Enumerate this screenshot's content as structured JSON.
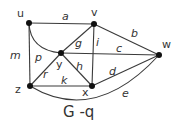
{
  "caption": "G -q",
  "vertices": {
    "u": {
      "label": "u",
      "x": 29,
      "y": 23
    },
    "v": {
      "label": "v",
      "x": 94,
      "y": 24
    },
    "w": {
      "label": "w",
      "x": 159,
      "y": 55
    },
    "y": {
      "label": "y",
      "x": 61,
      "y": 53
    },
    "z": {
      "label": "z",
      "x": 30,
      "y": 86
    },
    "x": {
      "label": "x",
      "x": 92,
      "y": 86
    }
  },
  "edges": {
    "a": {
      "label": "a",
      "from": "u",
      "to": "v"
    },
    "b": {
      "label": "b",
      "from": "v",
      "to": "w"
    },
    "c": {
      "label": "c",
      "from": "y",
      "to": "w"
    },
    "d": {
      "label": "d",
      "from": "x",
      "to": "w"
    },
    "e": {
      "label": "e",
      "from": "z",
      "to": "w",
      "curved": true
    },
    "g": {
      "label": "g",
      "from": "y",
      "to": "v"
    },
    "i": {
      "label": "i",
      "from": "v",
      "to": "x"
    },
    "h": {
      "label": "h",
      "from": "y",
      "to": "x"
    },
    "k": {
      "label": "k",
      "from": "z",
      "to": "x"
    },
    "r": {
      "label": "r",
      "from": "z",
      "to": "y"
    },
    "m": {
      "label": "m",
      "from": "u",
      "to": "z"
    },
    "p": {
      "label": "p",
      "from": "u",
      "to": "y",
      "curved": true
    }
  },
  "colors": {
    "edge": "#3a3a3a",
    "node": "#111111",
    "text": "#333333",
    "background": "#ffffff"
  }
}
